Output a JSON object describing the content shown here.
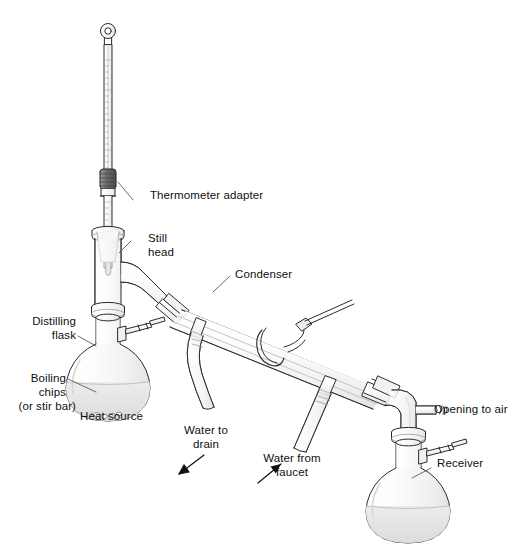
{
  "figure": {
    "type": "labeled-science-diagram",
    "background_color": "#ffffff",
    "line_color": "#2b2b2b",
    "glass_fill": "#fbfbfb",
    "liquid_color": "#e3e3e3",
    "shadow_color": "#d9d9d9",
    "adapter_cap_color": "#6e6e6e"
  },
  "labels": {
    "thermometer_adapter": "Thermometer adapter",
    "still_head_line1": "Still",
    "still_head_line2": "head",
    "condenser": "Condenser",
    "distilling_flask_line1": "Distilling",
    "distilling_flask_line2": "flask",
    "boiling_chips_line1": "Boiling",
    "boiling_chips_line2": "chips",
    "boiling_chips_line3": "(or stir bar)",
    "heat_source": "Heat source",
    "water_to_drain_line1": "Water to",
    "water_to_drain_line2": "drain",
    "water_from_faucet_line1": "Water from",
    "water_from_faucet_line2": "faucet",
    "opening_to_air": "Opening to air",
    "receiver": "Receiver"
  },
  "parts": [
    {
      "name": "thermometer",
      "description": "graduated thermometer with ring loop at top"
    },
    {
      "name": "thermometer-adapter",
      "description": "dark threaded cap joining thermometer to still head"
    },
    {
      "name": "still-head",
      "description": "vertical glass tube with downward side arm"
    },
    {
      "name": "distilling-flask",
      "description": "round-bottom flask holding liquid and boiling chips"
    },
    {
      "name": "condenser",
      "description": "double walled water-jacketed condenser angled downward"
    },
    {
      "name": "vacuum-adapter",
      "description": "bent adapter with side arm open to air"
    },
    {
      "name": "receiver-flask",
      "description": "round-bottom flask collecting distillate"
    },
    {
      "name": "drain-hose",
      "description": "S-curved rubber hose carrying water to drain"
    },
    {
      "name": "inlet-hose",
      "description": "straight rubber hose carrying water from faucet"
    },
    {
      "name": "clamp",
      "description": "metal clamp holding glassware"
    }
  ],
  "arrows": [
    {
      "name": "water-to-drain-arrow",
      "direction": "down-left"
    },
    {
      "name": "water-from-faucet-arrow",
      "direction": "up-right"
    }
  ]
}
